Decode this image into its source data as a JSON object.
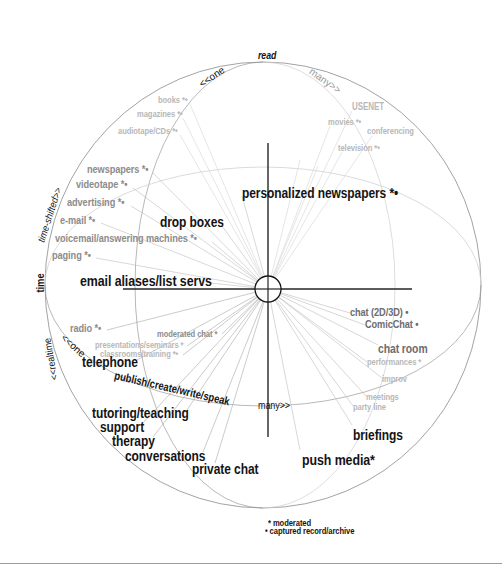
{
  "axes": {
    "read": "read",
    "time": "time",
    "time_shifted": "time-shifted>>",
    "realtime": "<<realtime",
    "read_one": "<<one",
    "read_many": "many>>",
    "realtime_one": "<<one",
    "realtime_many": "many>>",
    "publish": "publish/create/write/speak"
  },
  "labels": {
    "read_one": [
      "books *•",
      "magazines *•",
      "audiotape/CDs *•"
    ],
    "read_many": [
      "USENET",
      "movies *•",
      "conferencing",
      "television *•"
    ],
    "time_shifted_secondary": [
      "newspapers *•",
      "videotape *•",
      "advertising *•",
      "e-mail *•",
      "voicemail/answering machines *•",
      "paging *•"
    ],
    "time_shifted_primary": [
      "drop boxes",
      "personalized newspapers *•",
      "email aliases/list servs"
    ],
    "realtime_one_secondary": [
      "radio *•",
      "moderated chat *",
      "presentations/seminars *",
      "classrooms/training *•"
    ],
    "realtime_one_primary": [
      "telephone",
      "tutoring/teaching",
      "support",
      "therapy",
      "conversations",
      "private chat"
    ],
    "realtime_many_secondary": [
      "chat (2D/3D) •",
      "ComicChat •",
      "chat room",
      "performances *",
      "improv",
      "meetings",
      "party line"
    ],
    "realtime_many_primary": [
      "briefings",
      "push media*"
    ]
  },
  "legend": {
    "moderated": "* moderated",
    "captured": "• captured record/archive"
  },
  "colors": {
    "primary_text": "#141414",
    "secondary_text": "#8c8c8c",
    "tertiary_text": "#b8b8b8",
    "sphere_line": "#888888",
    "spoke_line": "#c4c4c4"
  }
}
